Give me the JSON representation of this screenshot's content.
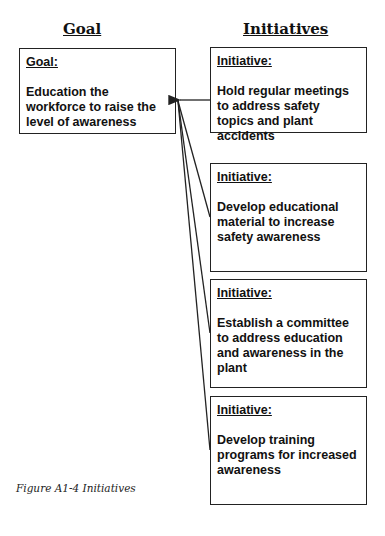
{
  "headers": {
    "goal": "Goal",
    "initiatives": "Initiatives"
  },
  "goal": {
    "label": "Goal:",
    "text": "Education the workforce to raise the level of awareness"
  },
  "initiatives": [
    {
      "label": "Initiative:",
      "text": "Hold regular meetings to address safety topics and plant accidents"
    },
    {
      "label": "Initiative:",
      "text": "Develop educational material to increase safety awareness"
    },
    {
      "label": "Initiative:",
      "text": "Establish a committee to address education and awareness in the plant"
    },
    {
      "label": "Initiative:",
      "text": "Develop training programs for increased awareness"
    }
  ],
  "caption": "Figure A1-4  Initiatives",
  "colors": {
    "line": "#222222",
    "text": "#111111",
    "background": "#ffffff"
  }
}
